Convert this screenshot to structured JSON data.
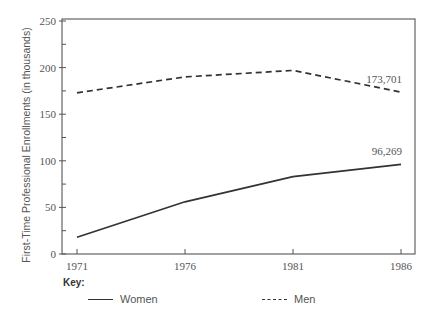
{
  "chart_data": {
    "type": "line",
    "title": "",
    "xlabel": "",
    "ylabel": "First-Time Professional Enrollments (in thousands)",
    "categories": [
      "1971",
      "1976",
      "1981",
      "1986"
    ],
    "x": [
      1971,
      1976,
      1981,
      1986
    ],
    "ylim": [
      0,
      250
    ],
    "yticks": [
      0,
      50,
      100,
      150,
      200,
      250
    ],
    "grid": false,
    "legend_position": "bottom",
    "series": [
      {
        "name": "Women",
        "style": "solid",
        "values": [
          18,
          56,
          83,
          96.269
        ],
        "end_label": "96,269"
      },
      {
        "name": "Men",
        "style": "dashed",
        "values": [
          173,
          190,
          197,
          173.701
        ],
        "end_label": "173,701"
      }
    ]
  },
  "key": {
    "title": "Key:",
    "items": [
      {
        "label": "Women",
        "style": "solid"
      },
      {
        "label": "Men",
        "style": "dashed"
      }
    ]
  },
  "colors": {
    "line": "#333333",
    "axis": "#555555",
    "text": "#555555"
  }
}
